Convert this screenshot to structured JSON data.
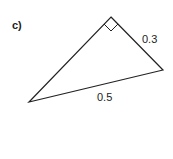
{
  "part_label": "c)",
  "triangle": {
    "vertices": {
      "top": [
        111,
        17
      ],
      "right": [
        163,
        70
      ],
      "left": [
        29,
        102
      ]
    },
    "right_angle_at": "top",
    "sides": [
      {
        "between": [
          "top",
          "right"
        ],
        "label": "0.3"
      },
      {
        "between": [
          "left",
          "right"
        ],
        "label": "0.5"
      }
    ]
  },
  "colors": {
    "stroke": "#222222",
    "background": "#ffffff"
  }
}
